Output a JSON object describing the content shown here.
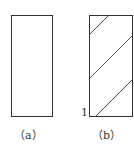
{
  "figures": [
    {
      "label": "（a）",
      "hatched": false
    },
    {
      "label": "（b）",
      "hatched": true,
      "marker": "1"
    }
  ],
  "colors": {
    "stroke": "#333333",
    "hatch": "#555555"
  }
}
